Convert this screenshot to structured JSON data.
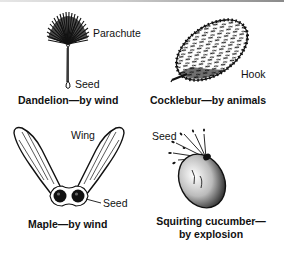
{
  "diagram": {
    "panels": [
      {
        "id": "dandelion",
        "caption": "Dandelion—by wind",
        "labels": {
          "parachute": "Parachute",
          "seed": "Seed"
        }
      },
      {
        "id": "cocklebur",
        "caption": "Cocklebur—by animals",
        "labels": {
          "hook": "Hook"
        }
      },
      {
        "id": "maple",
        "caption": "Maple—by wind",
        "labels": {
          "wing": "Wing",
          "seed": "Seed"
        }
      },
      {
        "id": "squirting-cucumber",
        "caption_line1": "Squirting cucumber—",
        "caption_line2": "by explosion",
        "labels": {
          "seed": "Seed"
        }
      }
    ]
  },
  "colors": {
    "ink": "#111111",
    "background": "#ffffff",
    "top_border": "#8a8a8a"
  }
}
